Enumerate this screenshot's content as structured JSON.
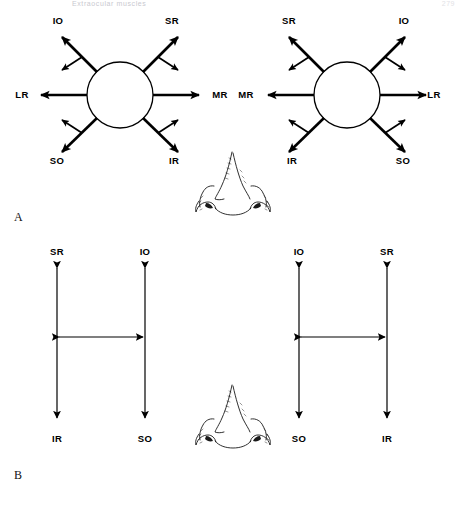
{
  "page": {
    "running_head": "Extraocular  muscles",
    "folio": "279",
    "background_color": "#ffffff",
    "ink_color": "#000000"
  },
  "figure": {
    "panels": [
      {
        "letter": "A",
        "caption_letter": "A",
        "description": "Fields of action of the extraocular muscles, right and left eye, shown as radial arrows around the globe",
        "eyes": [
          {
            "side": "left-eye-of-figure",
            "globe": {
              "cx": 120,
              "cy": 95,
              "r": 33
            },
            "arrows": [
              {
                "name": "IO",
                "label": "IO",
                "direction": "up-left",
                "kind": "primary-oblique",
                "label_x": 58,
                "label_y": 24
              },
              {
                "name": "SR",
                "label": "SR",
                "direction": "up-right",
                "kind": "primary-oblique",
                "label_x": 172,
                "label_y": 24
              },
              {
                "name": "LR",
                "label": "LR",
                "direction": "left",
                "kind": "primary-horizontal",
                "label_x": 22,
                "label_y": 92
              },
              {
                "name": "MR",
                "label": "MR",
                "direction": "right",
                "kind": "primary-horizontal",
                "label_x": 220,
                "label_y": 92
              },
              {
                "name": "SO",
                "label": "SO",
                "direction": "down-left",
                "kind": "primary-oblique",
                "label_x": 57,
                "label_y": 161
              },
              {
                "name": "IR",
                "label": "IR",
                "direction": "down-right",
                "kind": "primary-oblique",
                "label_x": 174,
                "label_y": 161
              }
            ]
          },
          {
            "side": "right-eye-of-figure",
            "globe": {
              "cx": 347,
              "cy": 95,
              "r": 33
            },
            "arrows": [
              {
                "name": "SR",
                "label": "SR",
                "direction": "up-left",
                "kind": "primary-oblique",
                "label_x": 289,
                "label_y": 24
              },
              {
                "name": "IO",
                "label": "IO",
                "direction": "up-right",
                "kind": "primary-oblique",
                "label_x": 404,
                "label_y": 24
              },
              {
                "name": "MR",
                "label": "MR",
                "direction": "left",
                "kind": "primary-horizontal",
                "label_x": 246,
                "label_y": 92
              },
              {
                "name": "LR",
                "label": "LR",
                "direction": "right",
                "kind": "primary-horizontal",
                "label_x": 430,
                "label_y": 92
              },
              {
                "name": "IR",
                "label": "IR",
                "direction": "down-left",
                "kind": "primary-oblique",
                "label_x": 292,
                "label_y": 161
              },
              {
                "name": "SO",
                "label": "SO",
                "direction": "down-right",
                "kind": "primary-oblique",
                "label_x": 403,
                "label_y": 161
              }
            ]
          }
        ]
      },
      {
        "letter": "B",
        "caption_letter": "B",
        "description": "Simplified yoke diagram of vertical muscle actions, right and left eye",
        "eyes": [
          {
            "side": "left-eye-of-figure",
            "columns": [
              {
                "x": 57,
                "top_label": "SR",
                "bottom_label": "IR"
              },
              {
                "x": 145,
                "top_label": "IO",
                "bottom_label": "SO"
              }
            ],
            "crossbar_y": 337
          },
          {
            "side": "right-eye-of-figure",
            "columns": [
              {
                "x": 299,
                "top_label": "IO",
                "bottom_label": "SO"
              },
              {
                "x": 387,
                "top_label": "SR",
                "bottom_label": "IR"
              }
            ],
            "crossbar_y": 337
          }
        ]
      }
    ],
    "muscle_legend": {
      "SR": "superior rectus",
      "IR": "inferior rectus",
      "LR": "lateral rectus",
      "MR": "medial rectus",
      "SO": "superior oblique",
      "IO": "inferior oblique"
    },
    "nose_sketch": {
      "name": "nose-illustration",
      "count": 2,
      "positions": [
        "between-eyes-panel-a",
        "between-eyes-panel-b"
      ]
    }
  }
}
